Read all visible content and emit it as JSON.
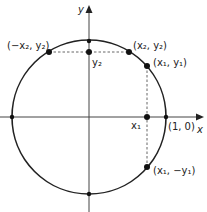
{
  "diagram": {
    "type": "unit-circle",
    "axes": {
      "x_label": "x",
      "y_label": "y"
    },
    "labels": {
      "neg_x2_y2": "(−x₂, y₂)",
      "x2_y2": "(x₂, y₂)",
      "x1_y1": "(x₁, y₁)",
      "y2": "y₂",
      "x1": "x₁",
      "one_zero": "(1, 0)",
      "x1_neg_y1": "(x₁, −y₁)"
    },
    "colors": {
      "stroke": "#222222",
      "dash": "#555555",
      "background": "#ffffff"
    }
  }
}
